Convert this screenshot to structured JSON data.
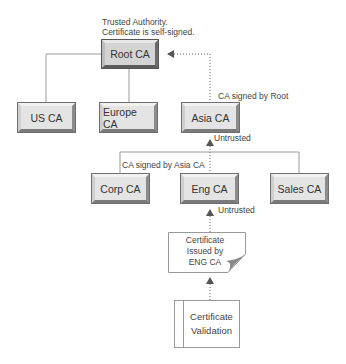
{
  "diagram": {
    "type": "certificate-chain-hierarchy",
    "annotations": {
      "root_note_line1": "Trusted Authority.",
      "root_note_line2": "Certificate is self-signed.",
      "asia_signed": "CA signed by Root",
      "asia_untrusted": "Untrusted",
      "corp_signed": "CA signed by Asia CA",
      "eng_untrusted": "Untrusted"
    },
    "nodes": {
      "root": "Root CA",
      "us": "US CA",
      "europe": "Europe CA",
      "asia": "Asia CA",
      "corp": "Corp CA",
      "eng": "Eng CA",
      "sales": "Sales CA"
    },
    "certificate": {
      "line1": "Certificate",
      "line2": "Issued by",
      "line3": "ENG CA"
    },
    "validation": {
      "line1": "Certificate",
      "line2": "Validation"
    },
    "edges": [
      {
        "from": "Root CA",
        "to": "US CA",
        "style": "solid"
      },
      {
        "from": "Root CA",
        "to": "Europe CA",
        "style": "solid"
      },
      {
        "from": "Asia CA",
        "to": "Root CA",
        "style": "dotted-arrow"
      },
      {
        "from": "Asia CA",
        "to": "Corp CA",
        "style": "solid"
      },
      {
        "from": "Asia CA",
        "to": "Sales CA",
        "style": "solid"
      },
      {
        "from": "Eng CA",
        "to": "Asia CA",
        "style": "dotted-arrow"
      },
      {
        "from": "Certificate Issued by ENG CA",
        "to": "Eng CA",
        "style": "dotted-arrow"
      },
      {
        "from": "Certificate Validation",
        "to": "Certificate Issued by ENG CA",
        "style": "dotted-arrow"
      }
    ],
    "colors": {
      "line": "#9a9a9a",
      "box_fill": "#e4e4e4",
      "root_fill": "#d4d4d4",
      "text": "#333333"
    }
  }
}
